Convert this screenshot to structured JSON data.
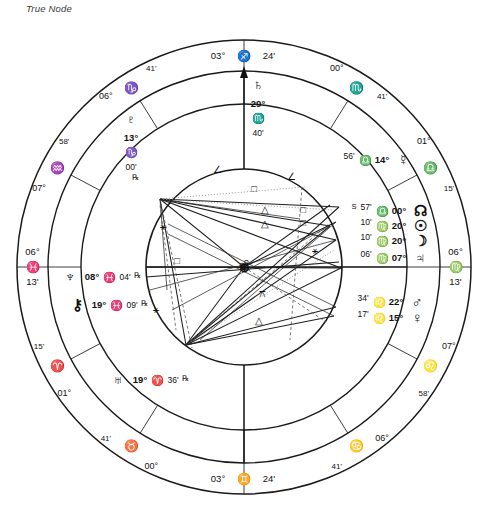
{
  "title": "True Node",
  "chart_data": {
    "type": "astrological-wheel",
    "center": {
      "x": 244,
      "y": 267
    },
    "radii": {
      "outer": 227,
      "sign_ring_inner": 196,
      "house_ring": 163,
      "inner_circle": 98
    },
    "house_cusps": [
      {
        "house": 1,
        "label_deg": "06°",
        "sign": "♈",
        "sign_name": "Aries",
        "label_min": "13'",
        "display_sign": "♓",
        "display_sign_name": "Pisces",
        "angle": 180,
        "is_axis": true,
        "axis": "ASC"
      },
      {
        "house": 2,
        "label_deg": "01°",
        "sign": "♈",
        "sign_name": "Aries",
        "label_min": "15'",
        "angle": 208,
        "is_axis": false
      },
      {
        "house": 3,
        "label_deg": "00°",
        "sign": "♉",
        "sign_name": "Taurus",
        "label_min": "41'",
        "angle": 238,
        "is_axis": false
      },
      {
        "house": 4,
        "label_deg": "03°",
        "sign": "♊",
        "sign_name": "Gemini",
        "label_min": "24'",
        "angle": 270,
        "is_axis": true,
        "axis": "IC"
      },
      {
        "house": 5,
        "label_deg": "06°",
        "sign": "♋",
        "sign_name": "Cancer",
        "label_min": "41'",
        "angle": 302,
        "is_axis": false
      },
      {
        "house": 6,
        "label_deg": "07°",
        "sign": "♌",
        "sign_name": "Leo",
        "label_min": "58'",
        "angle": 332,
        "is_axis": false
      },
      {
        "house": 7,
        "label_deg": "06°",
        "sign": "♍",
        "sign_name": "Virgo",
        "label_min": "13'",
        "angle": 0,
        "is_axis": true,
        "axis": "DSC"
      },
      {
        "house": 8,
        "label_deg": "01°",
        "sign": "♎",
        "sign_name": "Libra",
        "label_min": "15'",
        "angle": 28,
        "is_axis": false
      },
      {
        "house": 9,
        "label_deg": "00°",
        "sign": "♏",
        "sign_name": "Scorpio",
        "label_min": "41'",
        "angle": 58,
        "is_axis": false
      },
      {
        "house": 10,
        "label_deg": "03°",
        "sign": "♐",
        "sign_name": "Sagittarius",
        "label_min": "24'",
        "angle": 90,
        "is_axis": true,
        "axis": "MC"
      },
      {
        "house": 11,
        "label_deg": "06°",
        "sign": "♑",
        "sign_name": "Capricorn",
        "label_min": "41'",
        "angle": 122,
        "is_axis": false
      },
      {
        "house": 12,
        "label_deg": "07°",
        "sign": "♒",
        "sign_name": "Aquarius",
        "label_min": "58'",
        "angle": 152,
        "is_axis": false
      }
    ],
    "axis_labels": {
      "mc": {
        "deg": "03°",
        "sign": "♐",
        "min": "24'"
      },
      "ic": {
        "deg": "03°",
        "sign": "♊",
        "min": "24'"
      },
      "asc": {
        "deg": "06°",
        "sign": "♓",
        "min": "13'"
      },
      "dsc": {
        "deg": "06°",
        "sign": "♍",
        "min": "13'"
      }
    },
    "planets": [
      {
        "name": "Saturn",
        "glyph": "♄",
        "deg": "29°",
        "sign": "♏",
        "sign_name": "Scorpio",
        "min": "40'",
        "retro": "",
        "x": 258,
        "y": 90
      },
      {
        "name": "Pluto",
        "glyph": "♇",
        "deg": "13°",
        "sign": "♑",
        "sign_name": "Capricorn",
        "min": "00'",
        "retro": "℞",
        "x": 131,
        "y": 124
      },
      {
        "name": "Mercury",
        "glyph": "☿",
        "deg": "14°",
        "sign": "♎",
        "sign_name": "Libra",
        "min": "56'",
        "retro": "",
        "x": 385,
        "y": 160
      },
      {
        "name": "North Node",
        "glyph": "☊",
        "deg": "00°",
        "sign": "♎",
        "sign_name": "Libra",
        "min": "57'",
        "retro": "S",
        "x": 402,
        "y": 211
      },
      {
        "name": "Sun",
        "glyph": "☉",
        "deg": "20°",
        "sign": "♍",
        "sign_name": "Virgo",
        "min": "10'",
        "retro": "",
        "x": 402,
        "y": 226
      },
      {
        "name": "Moon",
        "glyph": "☽",
        "deg": "20°",
        "sign": "♍",
        "sign_name": "Virgo",
        "min": "10'",
        "retro": "",
        "x": 402,
        "y": 241
      },
      {
        "name": "Jupiter",
        "glyph": "♃",
        "deg": "07°",
        "sign": "♍",
        "sign_name": "Virgo",
        "min": "06'",
        "retro": "",
        "x": 402,
        "y": 258
      },
      {
        "name": "Mars",
        "glyph": "♂",
        "deg": "22°",
        "sign": "♌",
        "sign_name": "Leo",
        "min": "34'",
        "retro": "",
        "x": 399,
        "y": 302
      },
      {
        "name": "Venus",
        "glyph": "♀",
        "deg": "15°",
        "sign": "♌",
        "sign_name": "Leo",
        "min": "17'",
        "retro": "",
        "x": 399,
        "y": 318
      },
      {
        "name": "Neptune",
        "glyph": "♆",
        "deg": "08°",
        "sign": "♓",
        "sign_name": "Pisces",
        "min": "04'",
        "retro": "℞",
        "x": 70,
        "y": 277
      },
      {
        "name": "Chiron",
        "glyph": "⚷",
        "deg": "19°",
        "sign": "♓",
        "sign_name": "Pisces",
        "min": "09'",
        "retro": "℞",
        "x": 77,
        "y": 305
      },
      {
        "name": "Uranus",
        "glyph": "♅",
        "deg": "19°",
        "sign": "♈",
        "sign_name": "Aries",
        "min": "36'",
        "retro": "℞",
        "x": 118,
        "y": 380
      }
    ],
    "aspect_glyphs": [
      {
        "type": "square",
        "glyph": "□",
        "x": 254,
        "y": 192
      },
      {
        "type": "square",
        "glyph": "□",
        "x": 303,
        "y": 213
      },
      {
        "type": "square",
        "glyph": "□",
        "x": 303,
        "y": 226
      },
      {
        "type": "square",
        "glyph": "□",
        "x": 177,
        "y": 264
      },
      {
        "type": "trine",
        "glyph": "△",
        "x": 265,
        "y": 213
      },
      {
        "type": "trine",
        "glyph": "△",
        "x": 265,
        "y": 227
      },
      {
        "type": "trine",
        "glyph": "△",
        "x": 259,
        "y": 324
      },
      {
        "type": "semisextile",
        "glyph": "∠",
        "x": 217,
        "y": 173
      },
      {
        "type": "semisextile",
        "glyph": "∠",
        "x": 291,
        "y": 180
      },
      {
        "type": "sextile",
        "glyph": "⚹",
        "x": 163,
        "y": 230
      },
      {
        "type": "sextile",
        "glyph": "⚹",
        "x": 156,
        "y": 313
      },
      {
        "type": "sextile",
        "glyph": "⚹",
        "x": 315,
        "y": 254
      },
      {
        "type": "quincunx",
        "glyph": "⚻",
        "x": 262,
        "y": 297
      },
      {
        "type": "opposition",
        "glyph": "☍",
        "x": 244,
        "y": 267
      }
    ],
    "center_marker": {
      "glyph": "⊕",
      "label": "earth-center"
    }
  }
}
